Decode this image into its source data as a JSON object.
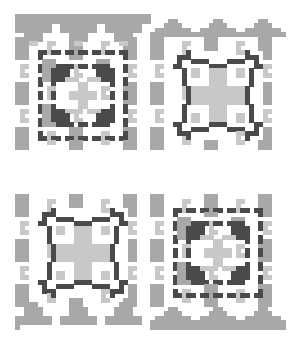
{
  "pattern": {
    "title": "",
    "cell_size": 4.5,
    "origin": {
      "x": 15,
      "y": 14
    },
    "cols": 60,
    "rows": 70,
    "colors": {
      "background": "#ffffff",
      "light": "#c8c8c8",
      "mid": "#a8a8a8",
      "dark": "#4a4a4a"
    },
    "quadrants": [
      {
        "position": "top-left",
        "motif": "dashed-frame",
        "col": 0,
        "row": 0
      },
      {
        "position": "top-right",
        "motif": "clover-frame",
        "col": 30,
        "row": 0
      },
      {
        "position": "bottom-left",
        "motif": "clover-frame",
        "col": 0,
        "row": 35
      },
      {
        "position": "bottom-right",
        "motif": "dashed-frame",
        "col": 30,
        "row": 35
      }
    ],
    "borders": [
      {
        "position": "top-left",
        "style": "inverted-steps"
      },
      {
        "position": "top-right",
        "style": "peaks"
      },
      {
        "position": "bottom-left",
        "style": "inverted-steps"
      },
      {
        "position": "bottom-right",
        "style": "peaks"
      }
    ]
  }
}
